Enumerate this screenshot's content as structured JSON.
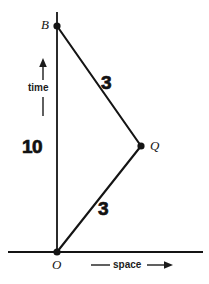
{
  "figure": {
    "type": "spacetime-diagram",
    "background_color": "#ffffff",
    "ink_color": "#141414"
  },
  "axes": {
    "vertical": {
      "name": "time",
      "label": "time",
      "direction": "up",
      "arrow_icon": "arrow-up-icon",
      "x": 57,
      "y_top": 12,
      "y_bottom": 252
    },
    "horizontal": {
      "name": "space",
      "label": "space",
      "direction": "right",
      "arrow_icon": "arrow-right-icon",
      "y": 252,
      "x_left": 8,
      "x_right": 203
    }
  },
  "points": [
    {
      "id": "B",
      "label": "B",
      "x": 57,
      "y": 26,
      "marker": "filled-dot"
    },
    {
      "id": "Q",
      "label": "Q",
      "x": 141,
      "y": 146,
      "marker": "filled-dot"
    },
    {
      "id": "O",
      "label": "O",
      "x": 57,
      "y": 252,
      "marker": "filled-dot"
    }
  ],
  "segments": [
    {
      "id": "BQ",
      "from": "B",
      "to": "Q",
      "length_label": "3"
    },
    {
      "id": "QO",
      "from": "Q",
      "to": "O",
      "length_label": "3"
    },
    {
      "id": "OB",
      "from": "O",
      "to": "B",
      "length_label": "10"
    }
  ],
  "measure_labels": {
    "upper_segment": "3",
    "vertical_segment": "10",
    "lower_segment": "3"
  }
}
